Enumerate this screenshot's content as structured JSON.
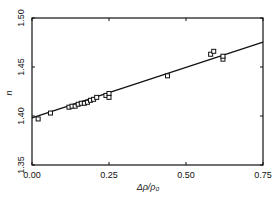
{
  "chart_data": {
    "type": "scatter",
    "title": "",
    "xlabel": "Δρ/ρ₀",
    "ylabel": "n",
    "xlim": [
      0.0,
      0.75
    ],
    "ylim": [
      1.35,
      1.5
    ],
    "x_ticks": [
      "0.00",
      "0.25",
      "0.50",
      "0.75"
    ],
    "y_ticks": [
      "1.35",
      "1.40",
      "1.45",
      "1.50"
    ],
    "grid": false,
    "legend": null,
    "series": [
      {
        "name": "measurements",
        "marker": "open-square",
        "points": [
          [
            0.02,
            1.397
          ],
          [
            0.06,
            1.403
          ],
          [
            0.12,
            1.409
          ],
          [
            0.13,
            1.41
          ],
          [
            0.14,
            1.41
          ],
          [
            0.15,
            1.412
          ],
          [
            0.16,
            1.413
          ],
          [
            0.17,
            1.413
          ],
          [
            0.18,
            1.414
          ],
          [
            0.19,
            1.416
          ],
          [
            0.2,
            1.417
          ],
          [
            0.21,
            1.419
          ],
          [
            0.24,
            1.421
          ],
          [
            0.25,
            1.423
          ],
          [
            0.25,
            1.419
          ],
          [
            0.44,
            1.441
          ],
          [
            0.58,
            1.463
          ],
          [
            0.59,
            1.466
          ],
          [
            0.62,
            1.458
          ],
          [
            0.62,
            1.461
          ]
        ]
      },
      {
        "name": "linear fit",
        "type": "line",
        "points": [
          [
            0.0,
            1.398
          ],
          [
            0.75,
            1.4755
          ]
        ]
      }
    ]
  }
}
